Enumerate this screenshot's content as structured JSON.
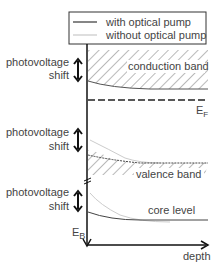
{
  "legend": {
    "with_pump": "with optical pump",
    "without_pump": "without optical pump"
  },
  "labels": {
    "conduction_band": "conduction band",
    "valence_band": "valence band",
    "core_level": "core level",
    "fermi_main": "E",
    "fermi_sub": "F",
    "binding_main": "E",
    "binding_sub": "B",
    "depth": "depth",
    "shift_line1": "photovoltage",
    "shift_line2": "shift"
  },
  "colors": {
    "with_pump": "#444444",
    "without_pump": "#c8c8c8",
    "hatch": "#555555",
    "axis": "#111111"
  }
}
